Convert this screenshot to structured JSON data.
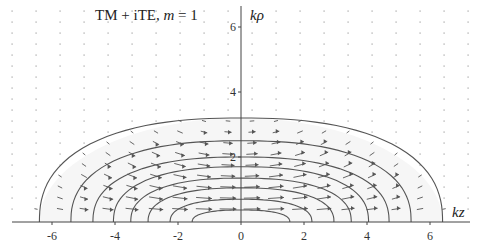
{
  "chart_data": {
    "type": "contour+vector",
    "title": "TM + iTE, m = 1",
    "title_parts": {
      "prefix": "TM + iTE, ",
      "var": "m",
      "suffix": " = 1"
    },
    "xlabel": "kz",
    "ylabel": "kρ",
    "xlim": [
      -7.5,
      7.5
    ],
    "ylim": [
      0,
      6.8
    ],
    "xticks": [
      -6,
      -4,
      -2,
      0,
      2,
      4,
      6
    ],
    "xtick_labels": [
      "-6",
      "-4",
      "-2",
      "0",
      "2",
      "4",
      "6"
    ],
    "yticks": [
      2,
      4,
      6
    ],
    "ytick_labels": [
      "2",
      "4",
      "6"
    ],
    "grid": false,
    "legend": null,
    "contours": [
      {
        "half_width": 6.4,
        "height": 3.2
      },
      {
        "half_width": 5.4,
        "height": 2.5
      },
      {
        "half_width": 4.7,
        "height": 2.0
      },
      {
        "half_width": 4.05,
        "height": 1.7
      },
      {
        "half_width": 3.5,
        "height": 1.35
      },
      {
        "half_width": 2.95,
        "height": 1.05
      },
      {
        "half_width": 2.25,
        "height": 0.7
      },
      {
        "half_width": 1.55,
        "height": 0.37
      }
    ],
    "vector_field": {
      "description": "Arrows pointing in +kz direction inside closed contours, strongest near kz=0, small kρ; decaying to dots outside",
      "x_spacing": 0.76,
      "y_spacing": 0.34
    },
    "colors": {
      "curve": "#555555",
      "axis": "#444444",
      "arrow": "#555555",
      "dot": "#bbbbbb",
      "fill": "#f6f6f6"
    }
  },
  "plot": {
    "title_text": "TM + iTE, ",
    "title_var": "m",
    "title_suffix": " = 1",
    "xlabel": "kz",
    "ylabel": "kρ"
  }
}
